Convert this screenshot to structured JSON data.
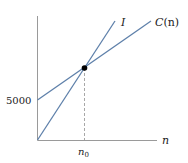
{
  "diagram": {
    "type": "break-even line diagram",
    "x_axis_label": "n",
    "y_tick_label": "5000",
    "x_tick_label_base": "n",
    "x_tick_label_sub": "0",
    "lines": [
      {
        "name": "cost",
        "label_main": "C",
        "label_arg": "(n)",
        "y_intercept": 5000
      },
      {
        "name": "income",
        "label": "I",
        "y_intercept": 0
      }
    ],
    "intersection": {
      "label": "n0",
      "marker": "filled-dot"
    },
    "colors": {
      "line": "#5e80aa",
      "axis": "#9a9a9a",
      "dashed": "#a8a8a8",
      "dot": "#000000",
      "text": "#222222"
    }
  }
}
